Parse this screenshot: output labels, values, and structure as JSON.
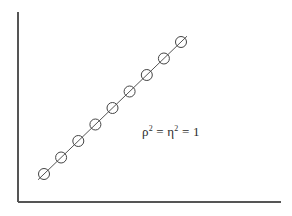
{
  "figure": {
    "background_color": "#ffffff",
    "ink_color": "#555555",
    "text_color": "#2b2b2b",
    "width": 292,
    "height": 216
  },
  "axes": {
    "name": "l-shaped-axes",
    "x_axis_label": "",
    "y_axis_label": "",
    "show_ticks": false,
    "show_tick_labels": false,
    "show_grid": false,
    "x_axis_start_px": 18,
    "x_axis_end_px": 281,
    "y_axis_top_px": 12,
    "y_axis_bottom_px": 202
  },
  "annotation": {
    "rho_symbol": "ρ",
    "rho_exponent": "2",
    "equals_1": "=",
    "eta_symbol": "η",
    "eta_exponent": "2",
    "equals_2": "=",
    "value": "1",
    "full_text": "ρ² = η² = 1"
  },
  "chart_data": {
    "type": "scatter",
    "title": "",
    "xlabel": "",
    "ylabel": "",
    "xlim": [
      0,
      10
    ],
    "ylim": [
      0,
      10
    ],
    "grid": false,
    "legend": "none",
    "marker_style": "circle-with-slash",
    "marker_radius_px": 5.5,
    "line_style": "solid",
    "line_color": "#555555",
    "annotations": [
      "ρ² = η² = 1"
    ],
    "x": [
      1,
      2,
      3,
      4,
      5,
      6,
      7,
      8,
      9
    ],
    "y": [
      1,
      2,
      3,
      4,
      5,
      6,
      7,
      8,
      9
    ],
    "series": [
      {
        "name": "perfect-linear-relationship",
        "x": [
          1,
          2,
          3,
          4,
          5,
          6,
          7,
          8,
          9
        ],
        "y": [
          1,
          2,
          3,
          4,
          5,
          6,
          7,
          8,
          9
        ]
      }
    ],
    "points_px": [
      {
        "cx": 44.0,
        "cy": 174.0
      },
      {
        "cx": 61.1,
        "cy": 157.5
      },
      {
        "cx": 78.3,
        "cy": 141.0
      },
      {
        "cx": 95.4,
        "cy": 124.5
      },
      {
        "cx": 112.5,
        "cy": 108.0
      },
      {
        "cx": 129.6,
        "cy": 91.5
      },
      {
        "cx": 146.8,
        "cy": 75.0
      },
      {
        "cx": 163.9,
        "cy": 58.5
      },
      {
        "cx": 181.0,
        "cy": 42.0
      }
    ],
    "line_px": {
      "x1": 38.0,
      "y1": 179.8,
      "x2": 187.0,
      "y2": 36.2
    }
  }
}
